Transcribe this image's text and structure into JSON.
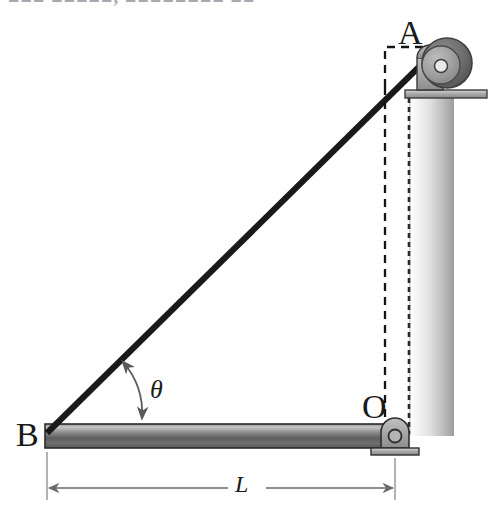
{
  "figure": {
    "type": "engineering-mechanics-diagram",
    "background_color": "#ffffff",
    "canvas": {
      "width": 493,
      "height": 525
    },
    "header_clipped_text": "■■■  ■■■■■, ■■■■■■■■ ■■"
  },
  "labels": {
    "point_a": "A",
    "point_b": "B",
    "point_o": "O",
    "angle": "θ",
    "length": "L"
  },
  "colors": {
    "line": "#1a1a1a",
    "bar_light": "#b9b9b9",
    "bar_mid": "#6e6e6e",
    "bar_dark": "#4a4a4a",
    "wall_light": "#f2f2f2",
    "wall_dark": "#9a9a9a",
    "pulley_outer": "#6b6b6b",
    "pulley_inner": "#9b9b9b",
    "bracket": "#a8a8a8",
    "dimension": "#6a6a6a",
    "dashed": "#1a1a1a"
  },
  "geometry": {
    "point_a": {
      "x": 425,
      "y": 60
    },
    "point_b": {
      "x": 47,
      "y": 428
    },
    "point_o": {
      "x": 395,
      "y": 428
    },
    "bar": {
      "x": 45,
      "y": 424,
      "width": 352,
      "height": 24
    },
    "wall": {
      "x": 409,
      "y": 96,
      "width": 45,
      "height": 340
    },
    "cable_width_px": 6,
    "dashed_rect": {
      "x": 385,
      "y": 47,
      "width": 37,
      "height": 40
    },
    "dashed_vertical": {
      "x": 385,
      "y_top": 47,
      "y_bottom": 448
    },
    "dimension_line_y": 488,
    "angle_arc_radius": 75
  },
  "elements": {
    "cable_name": "cable-ba",
    "bar_name": "horizontal-bar-ob",
    "wall_name": "vertical-wall",
    "pulley_name": "pulley-at-a",
    "pin_name": "pin-support-at-o",
    "dimension_name": "dimension-l",
    "angle_name": "angle-theta"
  }
}
